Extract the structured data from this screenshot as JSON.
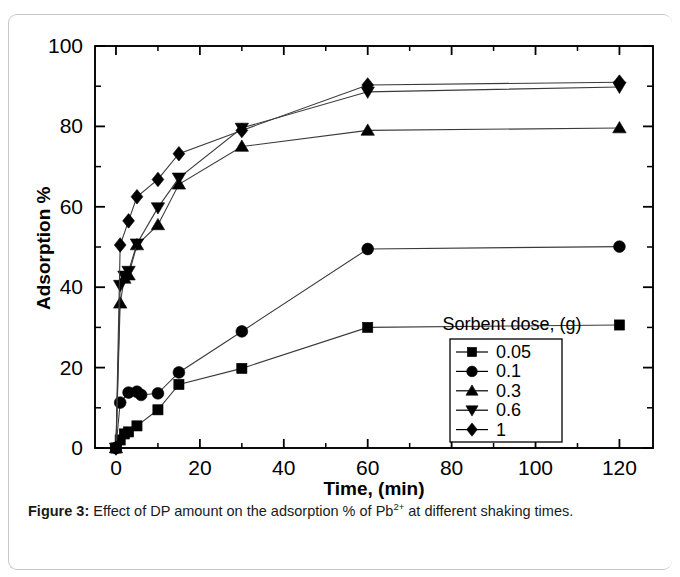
{
  "figure": {
    "caption_label": "Figure 3:",
    "caption_text_before": " Effect of DP amount on the adsorption % of Pb",
    "caption_superscript": "2+",
    "caption_text_after": " at different shaking times."
  },
  "chart_data": {
    "type": "line",
    "title": "",
    "xlabel": "Time, (min)",
    "ylabel": "Adsorption %",
    "xlim": [
      -5,
      128
    ],
    "ylim": [
      0,
      100
    ],
    "xticks": [
      0,
      20,
      40,
      60,
      80,
      100,
      120
    ],
    "xtick_labels": [
      "0",
      "20",
      "40",
      "60",
      "80",
      "100",
      "120"
    ],
    "yticks": [
      0,
      20,
      40,
      60,
      80,
      100
    ],
    "ytick_labels": [
      "0",
      "20",
      "40",
      "60",
      "80",
      "100"
    ],
    "x_minor_step": 10,
    "y_minor_step": 10,
    "grid": false,
    "legend_title": "Sorbent dose, (g)",
    "legend_position": "inside-lower-right",
    "series": [
      {
        "name": "0.05",
        "marker": "square",
        "x": [
          0,
          1,
          2,
          3,
          5,
          10,
          15,
          30,
          60,
          120
        ],
        "y": [
          0,
          2.0,
          3.5,
          4.0,
          5.5,
          9.5,
          15.8,
          19.8,
          30.0,
          30.6
        ]
      },
      {
        "name": "0.1",
        "marker": "circle",
        "x": [
          0,
          1,
          3,
          5,
          6,
          10,
          15,
          30,
          60,
          120
        ],
        "y": [
          0,
          11.3,
          13.8,
          14.0,
          13.2,
          13.6,
          18.8,
          29.0,
          49.5,
          50.1
        ]
      },
      {
        "name": "0.3",
        "marker": "triangle-up",
        "x": [
          0,
          1,
          2,
          3,
          5,
          10,
          15,
          30,
          60,
          120
        ],
        "y": [
          0,
          36.0,
          42.2,
          43.0,
          50.5,
          55.5,
          65.6,
          75.0,
          79.0,
          79.6
        ]
      },
      {
        "name": "0.6",
        "marker": "triangle-down",
        "x": [
          0,
          1,
          2,
          3,
          5,
          10,
          15,
          30,
          60,
          120
        ],
        "y": [
          0,
          40.5,
          42.8,
          44.0,
          50.8,
          59.8,
          67.2,
          79.6,
          88.6,
          89.8
        ]
      },
      {
        "name": "1",
        "marker": "diamond",
        "x": [
          0,
          1,
          3,
          5,
          10,
          15,
          30,
          60,
          120
        ],
        "y": [
          0,
          50.5,
          56.5,
          62.5,
          66.8,
          73.2,
          79.0,
          90.3,
          91.0
        ]
      }
    ]
  }
}
